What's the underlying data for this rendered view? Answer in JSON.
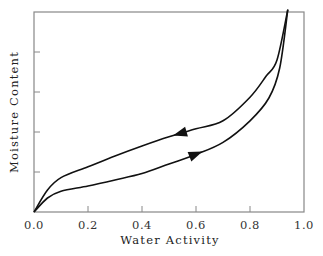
{
  "chart_data": {
    "type": "line",
    "title": "",
    "xlabel": "Water Activity",
    "ylabel": "Moisture Content",
    "xlim": [
      0.0,
      1.0
    ],
    "ylim": [
      0,
      5
    ],
    "x_ticks": [
      "0.0",
      "0.2",
      "0.4",
      "0.6",
      "0.8",
      "1.0"
    ],
    "y_ticks_unlabeled": [
      1,
      2,
      3,
      4
    ],
    "grid": false,
    "legend": null,
    "annotations": [
      {
        "type": "arrow",
        "series": "Desorption",
        "direction": "left",
        "at_x": 0.54
      },
      {
        "type": "arrow",
        "series": "Adsorption",
        "direction": "right",
        "at_x": 0.6
      }
    ],
    "series": [
      {
        "name": "Desorption",
        "x": [
          0.0,
          0.05,
          0.1,
          0.2,
          0.3,
          0.4,
          0.5,
          0.6,
          0.7,
          0.8,
          0.86,
          0.9,
          0.94
        ],
        "y": [
          0.0,
          0.55,
          0.86,
          1.13,
          1.4,
          1.65,
          1.88,
          2.08,
          2.28,
          2.87,
          3.4,
          3.8,
          5.06
        ]
      },
      {
        "name": "Adsorption",
        "x": [
          0.0,
          0.05,
          0.1,
          0.2,
          0.3,
          0.4,
          0.5,
          0.6,
          0.7,
          0.8,
          0.87,
          0.91,
          0.94
        ],
        "y": [
          0.0,
          0.35,
          0.52,
          0.65,
          0.8,
          0.96,
          1.2,
          1.44,
          1.74,
          2.28,
          2.85,
          3.6,
          5.06
        ]
      }
    ]
  }
}
